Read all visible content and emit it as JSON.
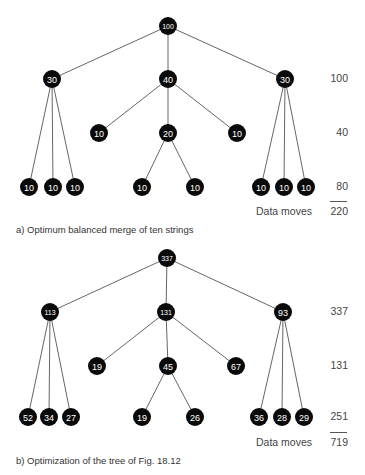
{
  "diagrams": [
    {
      "id": "a",
      "caption": "a)   Optimum balanced merge of ten strings",
      "nodes": [
        {
          "v": "100",
          "x": 168,
          "y": 26,
          "fs": 7
        },
        {
          "v": "30",
          "x": 52,
          "y": 79,
          "fs": 9
        },
        {
          "v": "40",
          "x": 168,
          "y": 79,
          "fs": 9
        },
        {
          "v": "30",
          "x": 285,
          "y": 79,
          "fs": 9
        },
        {
          "v": "10",
          "x": 99,
          "y": 133,
          "fs": 9
        },
        {
          "v": "20",
          "x": 168,
          "y": 133,
          "fs": 9
        },
        {
          "v": "10",
          "x": 237,
          "y": 133,
          "fs": 9
        },
        {
          "v": "10",
          "x": 29,
          "y": 187,
          "fs": 9
        },
        {
          "v": "10",
          "x": 53,
          "y": 187,
          "fs": 9
        },
        {
          "v": "10",
          "x": 75,
          "y": 187,
          "fs": 9
        },
        {
          "v": "10",
          "x": 142,
          "y": 187,
          "fs": 9
        },
        {
          "v": "10",
          "x": 195,
          "y": 187,
          "fs": 9
        },
        {
          "v": "10",
          "x": 261,
          "y": 187,
          "fs": 9
        },
        {
          "v": "10",
          "x": 284,
          "y": 187,
          "fs": 9
        },
        {
          "v": "10",
          "x": 306,
          "y": 187,
          "fs": 9
        }
      ],
      "edges": [
        [
          0,
          1
        ],
        [
          0,
          2
        ],
        [
          0,
          3
        ],
        [
          1,
          7
        ],
        [
          1,
          8
        ],
        [
          1,
          9
        ],
        [
          2,
          4
        ],
        [
          2,
          5
        ],
        [
          2,
          6
        ],
        [
          5,
          10
        ],
        [
          5,
          11
        ],
        [
          3,
          12
        ],
        [
          3,
          13
        ],
        [
          3,
          14
        ]
      ],
      "level_sums": [
        {
          "value": "100",
          "y": 79
        },
        {
          "value": "40",
          "y": 133
        },
        {
          "value": "80",
          "y": 187
        }
      ],
      "rule_y": 201,
      "total_label": "Data moves",
      "total_value": "220",
      "total_y": 212,
      "caption_y": 230
    },
    {
      "id": "b",
      "caption": "b)   Optimization of the tree of Fig. 18.12",
      "nodes": [
        {
          "v": "337",
          "x": 167,
          "y": 258,
          "fs": 7
        },
        {
          "v": "113",
          "x": 50,
          "y": 312,
          "fs": 7
        },
        {
          "v": "131",
          "x": 166,
          "y": 312,
          "fs": 7
        },
        {
          "v": "93",
          "x": 283,
          "y": 312,
          "fs": 9
        },
        {
          "v": "19",
          "x": 97,
          "y": 366,
          "fs": 9
        },
        {
          "v": "45",
          "x": 168,
          "y": 366,
          "fs": 9
        },
        {
          "v": "67",
          "x": 236,
          "y": 366,
          "fs": 9
        },
        {
          "v": "52",
          "x": 28,
          "y": 417,
          "fs": 9
        },
        {
          "v": "34",
          "x": 49,
          "y": 417,
          "fs": 9
        },
        {
          "v": "27",
          "x": 71,
          "y": 417,
          "fs": 9
        },
        {
          "v": "19",
          "x": 142,
          "y": 417,
          "fs": 9
        },
        {
          "v": "26",
          "x": 195,
          "y": 417,
          "fs": 9
        },
        {
          "v": "36",
          "x": 259,
          "y": 417,
          "fs": 9
        },
        {
          "v": "28",
          "x": 282,
          "y": 417,
          "fs": 9
        },
        {
          "v": "29",
          "x": 304,
          "y": 417,
          "fs": 9
        }
      ],
      "edges": [
        [
          0,
          1
        ],
        [
          0,
          2
        ],
        [
          0,
          3
        ],
        [
          1,
          7
        ],
        [
          1,
          8
        ],
        [
          1,
          9
        ],
        [
          2,
          4
        ],
        [
          2,
          5
        ],
        [
          2,
          6
        ],
        [
          5,
          10
        ],
        [
          5,
          11
        ],
        [
          3,
          12
        ],
        [
          3,
          13
        ],
        [
          3,
          14
        ]
      ],
      "level_sums": [
        {
          "value": "337",
          "y": 312
        },
        {
          "value": "131",
          "y": 366
        },
        {
          "value": "251",
          "y": 417
        }
      ],
      "rule_y": 432,
      "total_label": "Data moves",
      "total_value": "719",
      "total_y": 443,
      "caption_y": 461
    }
  ],
  "style": {
    "node_fill": "#0a0a0a",
    "node_text": "#ffffff",
    "edge": "#555555",
    "node_radius": 9
  }
}
